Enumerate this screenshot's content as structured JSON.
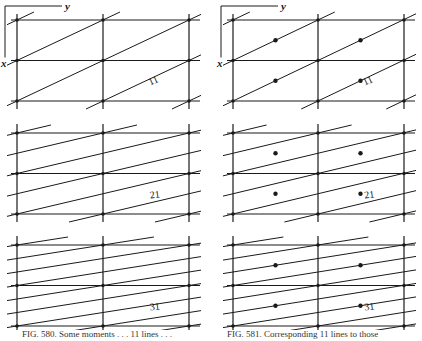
{
  "figure": {
    "ink_color": "#1a1a1a",
    "background": "#ffffff",
    "axis_labels": {
      "x": "x",
      "y": "y"
    },
    "left_caption": "FIG. 580. Some moments . . . 11 lines . . .",
    "right_caption": "FIG. 581. Corresponding 11 lines to those",
    "panels": [
      {
        "id": "left-top",
        "column": "left",
        "row": 0,
        "label": "11",
        "lines_per_cell": 1,
        "dots": false
      },
      {
        "id": "left-middle",
        "column": "left",
        "row": 1,
        "label": "21",
        "lines_per_cell": 2,
        "dots": false
      },
      {
        "id": "left-bottom",
        "column": "left",
        "row": 2,
        "label": "31",
        "lines_per_cell": 3,
        "dots": false
      },
      {
        "id": "right-top",
        "column": "right",
        "row": 0,
        "label": "11",
        "lines_per_cell": 1,
        "dots": true
      },
      {
        "id": "right-middle",
        "column": "right",
        "row": 1,
        "label": "21",
        "lines_per_cell": 2,
        "dots": true
      },
      {
        "id": "right-bottom",
        "column": "right",
        "row": 2,
        "label": "31",
        "lines_per_cell": 3,
        "dots": true
      }
    ]
  }
}
